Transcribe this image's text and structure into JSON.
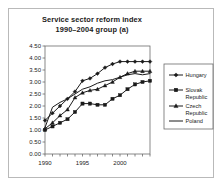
{
  "chart_data": {
    "type": "line",
    "title": "Service sector reform index",
    "subtitle": "1990–2004 group (a)",
    "xlabel": "",
    "ylabel": "",
    "xlim": [
      1990,
      2004
    ],
    "ylim": [
      0.0,
      4.5
    ],
    "ytick_step": 0.5,
    "grid": false,
    "legend_position": "right",
    "x": [
      1990,
      1991,
      1992,
      1993,
      1994,
      1995,
      1996,
      1997,
      1998,
      1999,
      2000,
      2001,
      2002,
      2003,
      2004
    ],
    "xtick_labels": [
      "1990",
      "1995",
      "2000"
    ],
    "xtick_label_values": [
      1990,
      1995,
      2000
    ],
    "ytick_labels": [
      "0.00",
      "0.50",
      "1.00",
      "1.50",
      "2.00",
      "2.50",
      "3.00",
      "3.50",
      "4.00",
      "4.50"
    ],
    "ytick_values": [
      0.0,
      0.5,
      1.0,
      1.5,
      2.0,
      2.5,
      3.0,
      3.5,
      4.0,
      4.5
    ],
    "series": [
      {
        "name": "Hungary",
        "marker": "diamond",
        "color": "#1a1a1a",
        "values": [
          1.4,
          1.7,
          2.0,
          2.3,
          2.6,
          3.05,
          3.15,
          3.35,
          3.6,
          3.75,
          3.85,
          3.85,
          3.85,
          3.85,
          3.85
        ]
      },
      {
        "name": "Slovak Republic",
        "marker": "square",
        "color": "#1a1a1a",
        "values": [
          1.0,
          1.15,
          1.3,
          1.45,
          1.75,
          2.1,
          2.1,
          2.05,
          2.05,
          2.3,
          2.45,
          2.7,
          2.9,
          3.0,
          3.05
        ]
      },
      {
        "name": "Czech Republic",
        "marker": "triangle",
        "color": "#1a1a1a",
        "values": [
          1.05,
          1.3,
          1.6,
          1.85,
          2.35,
          2.55,
          2.65,
          2.7,
          2.85,
          3.0,
          3.2,
          3.35,
          3.45,
          3.45,
          3.45
        ]
      },
      {
        "name": "Poland",
        "marker": "line",
        "color": "#1a1a1a",
        "values": [
          1.1,
          1.95,
          2.15,
          2.3,
          2.5,
          2.7,
          2.8,
          2.95,
          3.05,
          3.1,
          3.2,
          3.3,
          3.35,
          3.3,
          3.35
        ]
      }
    ]
  }
}
